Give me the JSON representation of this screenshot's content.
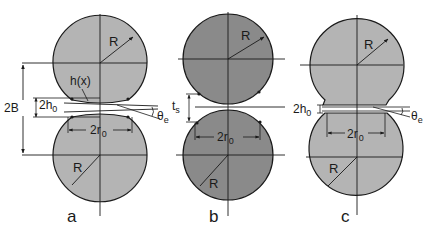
{
  "figure": {
    "colors": {
      "fill_light": "#b4b4b4",
      "fill_dark": "#8a8a8a",
      "stroke": "#1a1a1a",
      "background": "#ffffff"
    },
    "panels": [
      {
        "id": "a",
        "caption": "a",
        "radius_label_top": "R",
        "radius_label_bottom": "R",
        "profile_label": "h(x)",
        "gap_label": "2B",
        "neck_gap_label": "2h",
        "neck_gap_subscript": "0",
        "neck_width_label": "2r",
        "neck_width_subscript": "0",
        "angle_label": "θ",
        "angle_subscript": "e"
      },
      {
        "id": "b",
        "caption": "b",
        "radius_label_top": "R",
        "radius_label_bottom": "R",
        "separation_label": "t",
        "separation_subscript": "s",
        "neck_width_label": "2r",
        "neck_width_subscript": "0"
      },
      {
        "id": "c",
        "caption": "c",
        "radius_label_top": "R",
        "radius_label_bottom": "R",
        "neck_gap_label": "2h",
        "neck_gap_subscript": "0",
        "neck_width_label": "2r",
        "neck_width_subscript": "0",
        "angle_label": "θ",
        "angle_subscript": "e"
      }
    ]
  }
}
